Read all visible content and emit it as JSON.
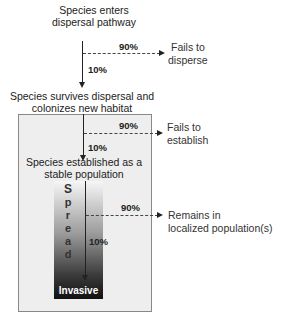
{
  "diagram": {
    "stages": [
      {
        "label_line1": "Species enters",
        "label_line2": "dispersal pathway"
      },
      {
        "label_line1": "Species survives dispersal and",
        "label_line2": "colonizes new habitat"
      },
      {
        "label_line1": "Species established as a",
        "label_line2": "stable population"
      },
      {
        "label": "Invasive"
      }
    ],
    "transitions": [
      {
        "fail_pct": "90%",
        "pass_pct": "10%",
        "fail_line1": "Fails to",
        "fail_line2": "disperse"
      },
      {
        "fail_pct": "90%",
        "pass_pct": "10%",
        "fail_line1": "Fails to",
        "fail_line2": "establish"
      },
      {
        "fail_pct": "90%",
        "pass_pct": "10%",
        "fail_line1": "Remains in",
        "fail_line2": "localized population(s)"
      }
    ],
    "spread_label": [
      "S",
      "p",
      "r",
      "e",
      "a",
      "d"
    ],
    "colors": {
      "box_fill": "#eeeeee",
      "box_border": "#888888",
      "gradient_top": "#f6f6f6",
      "gradient_bottom": "#111111",
      "arrow": "#222222"
    }
  }
}
